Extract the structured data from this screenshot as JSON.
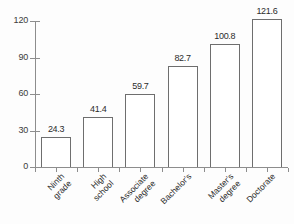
{
  "chart_data": {
    "type": "bar",
    "title": "",
    "subtitle": "",
    "xlabel": "",
    "ylabel": "",
    "categories": [
      "Ninth grade",
      "High school",
      "Associate degree",
      "Bachelor's",
      "Master's degree",
      "Doctorate"
    ],
    "category_lines": [
      [
        "Ninth",
        "grade"
      ],
      [
        "High",
        "school"
      ],
      [
        "Associate",
        "degree"
      ],
      [
        "Bachelor's"
      ],
      [
        "Master's",
        "degree"
      ],
      [
        "Doctorate"
      ]
    ],
    "values": [
      24.3,
      41.4,
      59.7,
      82.7,
      100.8,
      121.6
    ],
    "value_labels": [
      "24.3",
      "41.4",
      "59.7",
      "82.7",
      "100.8",
      "121.6"
    ],
    "ylim": [
      0,
      120
    ],
    "yticks": [
      0,
      30,
      60,
      90,
      120
    ],
    "ytick_labels": [
      "0",
      "30",
      "60",
      "90",
      "120"
    ],
    "grid": false,
    "legend": false,
    "legend_position": "none",
    "colors": {
      "bar_fill": "#ffffff",
      "bar_border": "#6e6e6e",
      "axis": "#8d8d8d",
      "text": "#2c2c2c",
      "background": "#fdfdfd"
    }
  }
}
